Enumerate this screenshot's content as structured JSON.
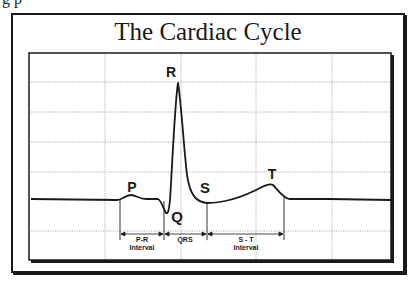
{
  "fragment_text": "g p",
  "diagram": {
    "title": "The Cardiac Cycle",
    "waves": {
      "P": "P",
      "Q": "Q",
      "R": "R",
      "S": "S",
      "T": "T"
    },
    "intervals": [
      {
        "line1": "P-R",
        "line2": "Interval"
      },
      {
        "line1": "QRS",
        "line2": ""
      },
      {
        "line1": "S - T",
        "line2": "Interval"
      }
    ],
    "grid": {
      "vertical_x": [
        105,
        181,
        256,
        332
      ],
      "horizontal_y": [
        82,
        112,
        142,
        172,
        231
      ]
    },
    "colors": {
      "line": "#1a1a1a",
      "grid": "#9a9a9a",
      "background": "#ffffff"
    }
  }
}
